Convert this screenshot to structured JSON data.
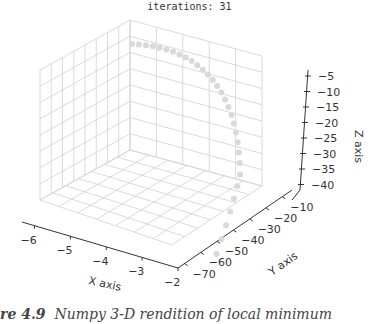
{
  "title": "iterations: 31",
  "caption": {
    "prefix": "re 4.9",
    "text": "Numpy 3-D rendition of local minimum"
  },
  "colors": {
    "points": "#d9d9d9",
    "grid": "#d0d0d0",
    "axis": "#333333"
  },
  "chart_data": {
    "type": "scatter",
    "projection": "3d",
    "title": "iterations: 31",
    "xlabel": "X axis",
    "ylabel": "Y axis",
    "zlabel": "Z axis",
    "x_ticks": [
      "−6",
      "−5",
      "−4",
      "−3",
      "−2"
    ],
    "y_ticks": [
      "−70",
      "−60",
      "−50",
      "−40",
      "−30",
      "−20",
      "−10"
    ],
    "z_ticks": [
      "−5",
      "−10",
      "−15",
      "−20",
      "−25",
      "−30",
      "−35",
      "−40"
    ],
    "xlim": [
      -6.5,
      -2
    ],
    "ylim": [
      -75,
      -5
    ],
    "zlim": [
      -43,
      -2
    ],
    "grid": true,
    "n_points": 31
  }
}
